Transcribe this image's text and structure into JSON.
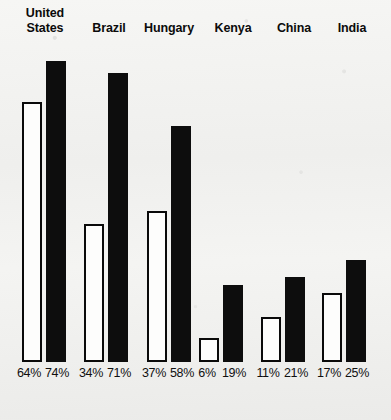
{
  "chart_data": {
    "type": "bar",
    "title": "",
    "subtitle": "",
    "xlabel": "",
    "ylabel": "",
    "ylim": [
      0,
      80
    ],
    "grid": false,
    "legend_position": "none",
    "orientation": "vertical",
    "categories": [
      "United States",
      "Brazil",
      "Hungary",
      "Kenya",
      "China",
      "India"
    ],
    "series": [
      {
        "name": "light",
        "style": "white-filled-outlined",
        "values": [
          64,
          34,
          37,
          6,
          11,
          17
        ],
        "value_labels": [
          "64%",
          "34%",
          "37%",
          "6%",
          "11%",
          "17%"
        ]
      },
      {
        "name": "dark",
        "style": "solid-black",
        "values": [
          74,
          71,
          58,
          19,
          21,
          25
        ],
        "value_labels": [
          "74%",
          "71%",
          "58%",
          "19%",
          "21%",
          "25%"
        ]
      }
    ],
    "tick_labels": [],
    "annotations": []
  },
  "groups": [
    {
      "label": "United\nStates",
      "label_left": 8,
      "label_top": 6,
      "label_width": 74,
      "group_left": 22,
      "light": {
        "value": 64,
        "label": "64%",
        "label_left": 15
      },
      "dark": {
        "value": 74,
        "label": "74%",
        "label_left": 43
      }
    },
    {
      "label": "Brazil",
      "label_left": 78,
      "label_top": 21,
      "label_width": 62,
      "group_left": 84,
      "light": {
        "value": 34,
        "label": "34%",
        "label_left": 77
      },
      "dark": {
        "value": 71,
        "label": "71%",
        "label_left": 105
      }
    },
    {
      "label": "Hungary",
      "label_left": 133,
      "label_top": 21,
      "label_width": 72,
      "group_left": 147,
      "light": {
        "value": 37,
        "label": "37%",
        "label_left": 140
      },
      "dark": {
        "value": 58,
        "label": "58%",
        "label_left": 168
      }
    },
    {
      "label": "Kenya",
      "label_left": 202,
      "label_top": 21,
      "label_width": 62,
      "group_left": 199,
      "light": {
        "value": 6,
        "label": "6%",
        "label_left": 193
      },
      "dark": {
        "value": 19,
        "label": "19%",
        "label_left": 220
      }
    },
    {
      "label": "China",
      "label_left": 263,
      "label_top": 21,
      "label_width": 62,
      "group_left": 261,
      "light": {
        "value": 11,
        "label": "11%",
        "label_left": 254
      },
      "dark": {
        "value": 21,
        "label": "21%",
        "label_left": 282
      }
    },
    {
      "label": "India",
      "label_left": 323,
      "label_top": 21,
      "label_width": 58,
      "group_left": 322,
      "light": {
        "value": 17,
        "label": "17%",
        "label_left": 315
      },
      "dark": {
        "value": 25,
        "label": "25%",
        "label_left": 343
      }
    }
  ],
  "scale": {
    "pixels_per_percent": 4.07,
    "baseline_y": 362,
    "plot_top_y": 55
  },
  "colors": {
    "background": "#f2f2f0",
    "bar_dark": "#0d0d0d",
    "bar_light_fill": "#fdfdfc",
    "bar_outline": "#0a0a0a",
    "text": "#0b0b0b"
  }
}
